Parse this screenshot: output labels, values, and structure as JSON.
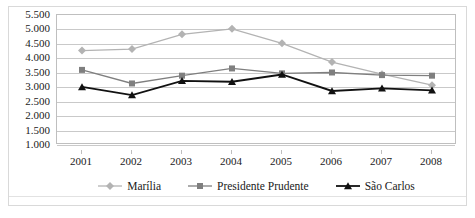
{
  "chart_data": {
    "type": "line",
    "title": "",
    "subtitle": "",
    "xlabel": "",
    "ylabel": "",
    "categories": [
      "2001",
      "2002",
      "2003",
      "2004",
      "2005",
      "2006",
      "2007",
      "2008"
    ],
    "ylim": [
      1.0,
      5.5
    ],
    "ytick_step": 0.5,
    "ytick_labels": [
      "5.500",
      "5.000",
      "4.500",
      "4.000",
      "3.500",
      "3.000",
      "2.500",
      "2.000",
      "1.500",
      "1.000"
    ],
    "ytick_values": [
      5.5,
      5.0,
      4.5,
      4.0,
      3.5,
      3.0,
      2.5,
      2.0,
      1.5,
      1.0
    ],
    "grid": true,
    "legend_position": "bottom",
    "decimal_separator": "comma",
    "series": [
      {
        "name": "Marília",
        "color": "#b3b3b3",
        "marker": "diamond",
        "values": [
          4.27,
          4.32,
          4.83,
          5.02,
          4.52,
          3.87,
          3.45,
          3.07
        ]
      },
      {
        "name": "Presidente Prudente",
        "color": "#7f7f7f",
        "marker": "square",
        "values": [
          3.6,
          3.13,
          3.4,
          3.65,
          3.48,
          3.51,
          3.42,
          3.4
        ]
      },
      {
        "name": "São Carlos",
        "color": "#111111",
        "marker": "triangle",
        "values": [
          3.01,
          2.73,
          3.22,
          3.19,
          3.44,
          2.87,
          2.96,
          2.89
        ]
      }
    ]
  },
  "legend": {
    "items": [
      {
        "label": "Marília"
      },
      {
        "label": "Presidente Prudente"
      },
      {
        "label": "São Carlos"
      }
    ]
  },
  "colors": {
    "gridline": "#c9c9c9",
    "plot_border": "#bfbfbf",
    "frame_border": "#d9d9d9",
    "text": "#1a1a1a",
    "background": "#ffffff"
  }
}
